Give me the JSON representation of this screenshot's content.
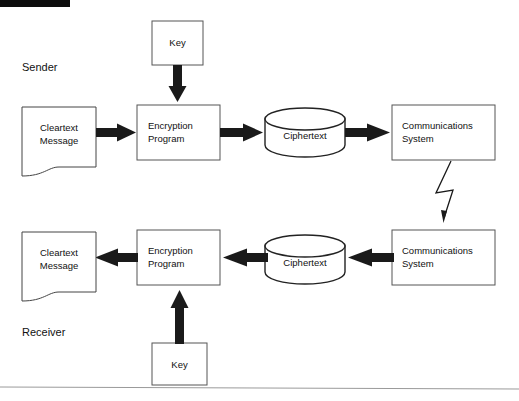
{
  "diagram": {
    "title_bar": "",
    "roles": {
      "sender_label": "Sender",
      "receiver_label": "Receiver"
    },
    "sender_row": {
      "key": "Key",
      "cleartext_line1": "Cleartext",
      "cleartext_line2": "Message",
      "program_line1": "Encryption",
      "program_line2": "Program",
      "ciphertext": "Ciphertext",
      "comms_line1": "Communications",
      "comms_line2": "System"
    },
    "receiver_row": {
      "key": "Key",
      "cleartext_line1": "Cleartext",
      "cleartext_line2": "Message",
      "program_line1": "Encryption",
      "program_line2": "Program",
      "ciphertext": "Ciphertext",
      "comms_line1": "Communications",
      "comms_line2": "System"
    },
    "colors": {
      "stroke": "#1a1a1a",
      "box_stroke": "#555555",
      "background": "#ffffff",
      "header_bar": "#0d0d0d",
      "footer_rule": "#9a9a9a"
    }
  }
}
